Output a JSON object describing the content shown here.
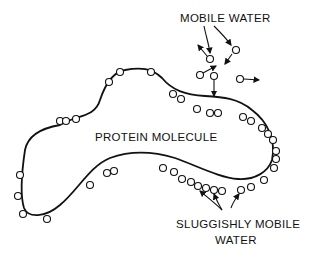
{
  "diagram": {
    "labels": {
      "mobile_water": "MOBILE WATER",
      "protein": "PROTEIN MOLECULE",
      "sluggish_line1": "SLUGGISHLY MOBILE",
      "sluggish_line2": "WATER"
    },
    "colors": {
      "ink": "#111111",
      "background": "#ffffff"
    }
  }
}
